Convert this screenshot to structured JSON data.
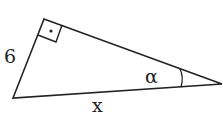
{
  "diagram": {
    "type": "right-triangle",
    "labels": {
      "left_side": "6",
      "bottom_side": "x",
      "angle": "α"
    },
    "right_angle_marker": "dot-in-square",
    "stroke_color": "#222222"
  }
}
